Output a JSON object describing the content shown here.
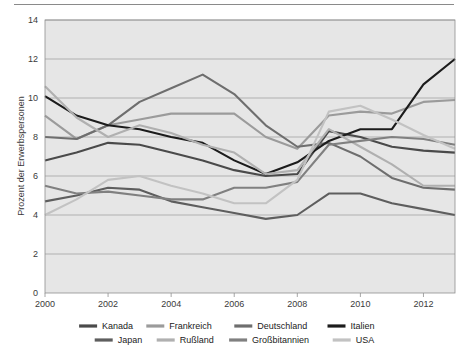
{
  "chart_data": {
    "type": "line",
    "title": "",
    "subtitle": "",
    "xlabel": "",
    "ylabel": "Prozent der Erwerbspersonen",
    "xlim": [
      2000,
      2013
    ],
    "ylim": [
      0,
      14
    ],
    "ytick_step": 2,
    "grid": true,
    "legend_position": "bottom",
    "x": [
      2000,
      2001,
      2002,
      2003,
      2004,
      2005,
      2006,
      2007,
      2008,
      2009,
      2010,
      2011,
      2012,
      2013
    ],
    "xticks": [
      "2000",
      "2002",
      "2004",
      "2006",
      "2008",
      "2010",
      "2012"
    ],
    "xtick_values": [
      2000,
      2002,
      2004,
      2006,
      2008,
      2010,
      2012
    ],
    "yticks": [
      "0",
      "2",
      "4",
      "6",
      "8",
      "10",
      "12",
      "14"
    ],
    "ytick_values": [
      0,
      2,
      4,
      6,
      8,
      10,
      12,
      14
    ],
    "series": [
      {
        "name": "Kanada",
        "color": "#4a4a4a",
        "values": [
          6.8,
          7.2,
          7.7,
          7.6,
          7.2,
          6.8,
          6.3,
          6.0,
          6.1,
          8.3,
          8.0,
          7.5,
          7.3,
          7.2
        ]
      },
      {
        "name": "Frankreich",
        "color": "#9b9b9b",
        "values": [
          9.1,
          7.9,
          8.6,
          8.9,
          9.2,
          9.2,
          9.2,
          8.0,
          7.4,
          9.1,
          9.3,
          9.2,
          9.8,
          9.9
        ]
      },
      {
        "name": "Deutschland",
        "color": "#6e6e6e",
        "values": [
          8.0,
          7.9,
          8.6,
          9.8,
          10.5,
          11.2,
          10.2,
          8.6,
          7.5,
          7.7,
          7.0,
          5.9,
          5.4,
          5.3
        ]
      },
      {
        "name": "Italien",
        "color": "#1c1c1c",
        "values": [
          10.1,
          9.1,
          8.6,
          8.4,
          8.0,
          7.7,
          6.8,
          6.1,
          6.7,
          7.8,
          8.4,
          8.4,
          10.7,
          12.0
        ]
      },
      {
        "name": "Japan",
        "color": "#5e5e5e",
        "values": [
          4.7,
          5.0,
          5.4,
          5.3,
          4.7,
          4.4,
          4.1,
          3.8,
          4.0,
          5.1,
          5.1,
          4.6,
          4.3,
          4.0
        ]
      },
      {
        "name": "Rußland",
        "color": "#b0b0b0",
        "values": [
          10.6,
          9.0,
          8.0,
          8.6,
          8.2,
          7.6,
          7.2,
          6.1,
          6.3,
          8.4,
          7.5,
          6.6,
          5.5,
          5.5
        ]
      },
      {
        "name": "Großbitannien",
        "color": "#808080",
        "values": [
          5.5,
          5.1,
          5.2,
          5.0,
          4.8,
          4.8,
          5.4,
          5.4,
          5.7,
          7.6,
          7.8,
          8.0,
          7.9,
          7.6
        ]
      },
      {
        "name": "USA",
        "color": "#c2c2c2",
        "values": [
          4.0,
          4.8,
          5.8,
          6.0,
          5.5,
          5.1,
          4.6,
          4.6,
          5.8,
          9.3,
          9.6,
          8.9,
          8.1,
          7.4
        ]
      }
    ]
  },
  "legend": {
    "row1": [
      "Kanada",
      "Frankreich",
      "Deutschland",
      "Italien"
    ],
    "row2": [
      "Japan",
      "Rußland",
      "Großbitannien",
      "USA"
    ]
  },
  "axes": {
    "y_title": "Prozent der Erwerbspersonen"
  }
}
